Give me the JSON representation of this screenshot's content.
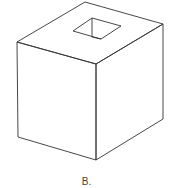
{
  "figure": {
    "stroke_color": "#333333",
    "fill_color": "#ffffff",
    "vertices": {
      "top_back": [
        85,
        2
      ],
      "top_left": [
        17,
        42
      ],
      "top_right": [
        163,
        24
      ],
      "top_front": [
        96,
        64
      ],
      "bottom_left": [
        18,
        137
      ],
      "bottom_front": [
        96,
        160
      ],
      "bottom_right": [
        163,
        119
      ]
    },
    "hole": {
      "left": [
        73,
        31
      ],
      "top": [
        92,
        18
      ],
      "right": [
        121,
        26
      ],
      "bottom": [
        101,
        39
      ],
      "inner_edge_bottom": [
        92,
        37
      ]
    }
  },
  "caption": {
    "label": "B."
  }
}
